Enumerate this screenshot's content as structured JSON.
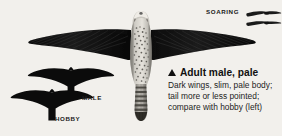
{
  "plate": {
    "background_color": "#f2f0ec",
    "ink_color": "#101010",
    "subject": "falcon-in-flight-from-below"
  },
  "soaring": {
    "label": "SOARING",
    "silhouette_count": 2
  },
  "silhouettes": [
    {
      "label": "MALE",
      "name": "male-silhouette"
    },
    {
      "label": "HOBBY",
      "name": "hobby-silhouette"
    }
  ],
  "caption": {
    "pointer_glyph": "up-triangle",
    "heading": "Adult male, pale",
    "lines": [
      "Dark wings, slim, pale body;",
      "tail more or less pointed;",
      "compare with hobby (left)"
    ]
  }
}
